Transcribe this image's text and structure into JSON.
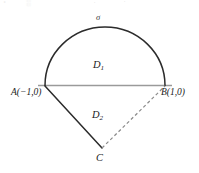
{
  "figure": {
    "type": "geometry-diagram",
    "width": 199,
    "height": 173,
    "colors": {
      "curve": "#2b2b2b",
      "diameter": "#9a9a9a",
      "dashed": "#8a8a8a",
      "text": "#222222",
      "background": "#ffffff"
    },
    "labels": {
      "sigma": "σ",
      "region_upper_base": "D",
      "region_upper_sub": "1",
      "region_lower_base": "D",
      "region_lower_sub": "2",
      "point_a": "A(−1,0)",
      "point_b": "B(1,0)",
      "point_c": "C"
    },
    "points": {
      "a": {
        "x": 45,
        "y": 85,
        "math": "(-1,0)"
      },
      "b": {
        "x": 165,
        "y": 85,
        "math": "(1,0)"
      },
      "c": {
        "x": 102,
        "y": 148
      },
      "arc_apex": {
        "x": 105,
        "y": 27
      }
    },
    "edges": {
      "arc_sigma": "solid",
      "diameter_ab": "solid",
      "segment_ac": "solid",
      "segment_cb": "dashed"
    },
    "artifacts": {
      "a1": "˚",
      "a2": "░",
      "a3": "˙",
      "a4": "˙"
    }
  }
}
